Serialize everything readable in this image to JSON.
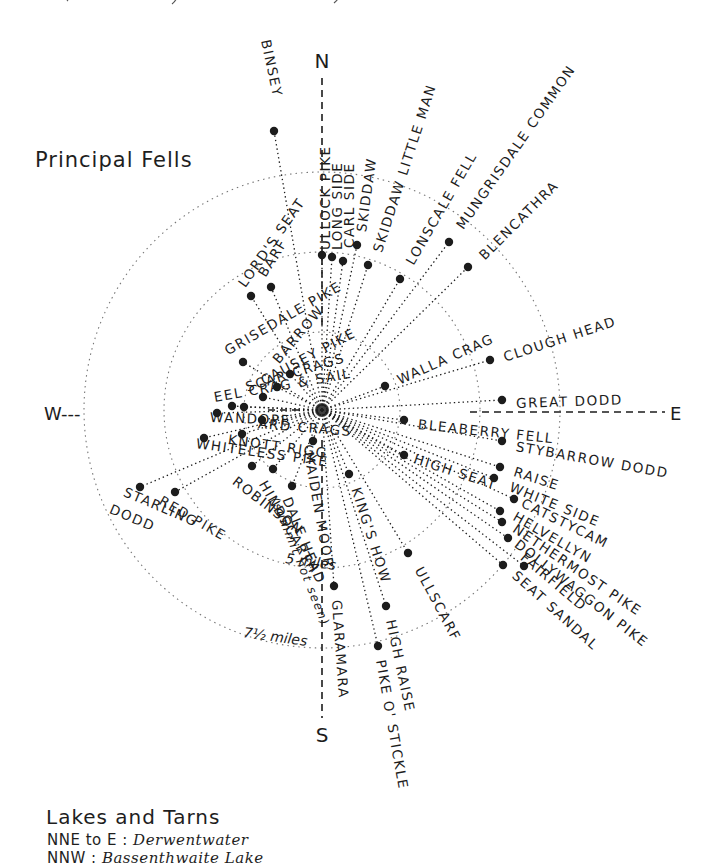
{
  "headings": {
    "principal_fells": "Principal Fells",
    "lakes_and_tarns": "Lakes and Tarns"
  },
  "lakes": [
    {
      "direction": "NNE to E :",
      "name": "Derwentwater"
    },
    {
      "direction": "NNW :",
      "name": "Bassenthwaite Lake"
    }
  ],
  "compass": {
    "center": [
      322,
      410
    ],
    "N": {
      "label": "N",
      "x": 322,
      "y": 72
    },
    "S": {
      "label": "S",
      "x": 322,
      "y": 738
    },
    "E": {
      "label": "E",
      "x": 676,
      "y": 416
    },
    "W": {
      "label": "W---",
      "x": 46,
      "y": 418
    }
  },
  "rings": [
    {
      "label": "5 miles",
      "radius": 158,
      "label_x": 285,
      "label_y": 563,
      "label_rot": 8
    },
    {
      "label": "7½ miles",
      "radius": 238,
      "label_x": 243,
      "label_y": 637,
      "label_rot": 8
    },
    {
      "label": "",
      "radius": 78
    }
  ],
  "colors": {
    "ink": "#1c1c1c",
    "paper": "#ffffff"
  },
  "fells": [
    {
      "name": "BINSEY",
      "dot": [
        274,
        131
      ],
      "label": [
        265,
        40
      ],
      "rot": 78,
      "anchor": "start"
    },
    {
      "name": "ULLOCK PIKE",
      "dot": [
        322,
        255
      ],
      "label": [
        326,
        250
      ],
      "rot": -90,
      "anchor": "start"
    },
    {
      "name": "LONG SIDE",
      "dot": [
        332,
        257
      ],
      "label": [
        338,
        250
      ],
      "rot": -90,
      "anchor": "start"
    },
    {
      "name": "CARL SIDE",
      "dot": [
        343,
        261
      ],
      "label": [
        350,
        248
      ],
      "rot": -90,
      "anchor": "start"
    },
    {
      "name": "SKIDDAW",
      "dot": [
        357,
        245
      ],
      "label": [
        362,
        232
      ],
      "rot": -82,
      "anchor": "start"
    },
    {
      "name": "SKIDDAW LITTLE MAN",
      "dot": [
        368,
        265
      ],
      "label": [
        378,
        252
      ],
      "rot": -72,
      "anchor": "start"
    },
    {
      "name": "LONSCALE FELL",
      "dot": [
        400,
        279
      ],
      "label": [
        410,
        264
      ],
      "rot": -60,
      "anchor": "start"
    },
    {
      "name": "MUNGRISDALE COMMON",
      "dot": [
        449,
        242
      ],
      "label": [
        460,
        228
      ],
      "rot": -55,
      "anchor": "start"
    },
    {
      "name": "BLENCATHRA",
      "dot": [
        468,
        267
      ],
      "label": [
        482,
        258
      ],
      "rot": -45,
      "anchor": "start"
    },
    {
      "name": "CLOUGH HEAD",
      "dot": [
        490,
        360
      ],
      "label": [
        504,
        358
      ],
      "rot": -18,
      "anchor": "start"
    },
    {
      "name": "WALLA CRAG",
      "dot": [
        385,
        386
      ],
      "label": [
        398,
        381
      ],
      "rot": -24,
      "anchor": "start"
    },
    {
      "name": "GREAT DODD",
      "dot": [
        502,
        400
      ],
      "label": [
        516,
        404
      ],
      "rot": -2,
      "anchor": "start"
    },
    {
      "name": "BLEABERRY FELL",
      "dot": [
        404,
        420
      ],
      "label": [
        418,
        425
      ],
      "rot": 6,
      "anchor": "start"
    },
    {
      "name": "STYBARROW DODD",
      "dot": [
        502,
        441
      ],
      "label": [
        516,
        447
      ],
      "rot": 10,
      "anchor": "start"
    },
    {
      "name": "HIGH SEAT",
      "dot": [
        404,
        455
      ],
      "label": [
        414,
        459
      ],
      "rot": 18,
      "anchor": "start"
    },
    {
      "name": "RAISE",
      "dot": [
        500,
        467
      ],
      "label": [
        514,
        472
      ],
      "rot": 18,
      "anchor": "start"
    },
    {
      "name": "WHITE SIDE",
      "dot": [
        494,
        478
      ],
      "label": [
        510,
        487
      ],
      "rot": 22,
      "anchor": "start"
    },
    {
      "name": "CATSTYCAM",
      "dot": [
        514,
        499
      ],
      "label": [
        522,
        503
      ],
      "rot": 26,
      "anchor": "start"
    },
    {
      "name": "HELVELLYN",
      "dot": [
        500,
        511
      ],
      "label": [
        514,
        516
      ],
      "rot": 30,
      "anchor": "start"
    },
    {
      "name": "NETHERMOST PIKE",
      "dot": [
        502,
        522
      ],
      "label": [
        514,
        528
      ],
      "rot": 34,
      "anchor": "start"
    },
    {
      "name": "DOLLYWAGGON PIKE",
      "dot": [
        508,
        538
      ],
      "label": [
        516,
        543
      ],
      "rot": 38,
      "anchor": "start"
    },
    {
      "name": "FAIRFIELD",
      "dot": [
        524,
        566
      ],
      "label": [
        522,
        556
      ],
      "rot": 40,
      "anchor": "start"
    },
    {
      "name": "SEAT SANDAL",
      "dot": [
        503,
        565
      ],
      "label": [
        514,
        574
      ],
      "rot": 42,
      "anchor": "start"
    },
    {
      "name": "ULLSCARF",
      "dot": [
        408,
        553
      ],
      "label": [
        418,
        568
      ],
      "rot": 62,
      "anchor": "start"
    },
    {
      "name": "KING'S HOW",
      "dot": [
        349,
        474
      ],
      "label": [
        355,
        488
      ],
      "rot": 72,
      "anchor": "start"
    },
    {
      "name": "HIGH RAISE",
      "dot": [
        386,
        606
      ],
      "label": [
        390,
        620
      ],
      "rot": 78,
      "anchor": "start"
    },
    {
      "name": "PIKE O' STICKLE",
      "dot": [
        378,
        646
      ],
      "label": [
        380,
        660
      ],
      "rot": 80,
      "anchor": "start"
    },
    {
      "name": "GLARAMARA",
      "dot": [
        334,
        586
      ],
      "label": [
        336,
        600
      ],
      "rot": 86,
      "anchor": "start"
    },
    {
      "name": "MAIDEN MOOR",
      "dot": [
        313,
        441
      ],
      "label": [
        308,
        452
      ],
      "rot": -100,
      "anchor": "end"
    },
    {
      "name": "DALE HEAD",
      "dot": [
        292,
        486
      ],
      "label": [
        286,
        498
      ],
      "rot": -112,
      "anchor": "end"
    },
    {
      "name": "(summit not seen)",
      "dot": null,
      "label": [
        274,
        498
      ],
      "rot": -112,
      "anchor": "end",
      "small": true
    },
    {
      "name": "HINDSCARTH",
      "dot": [
        273,
        469
      ],
      "label": [
        262,
        482
      ],
      "rot": -120,
      "anchor": "end"
    },
    {
      "name": "ROBINSON",
      "dot": [
        252,
        466
      ],
      "label": [
        234,
        480
      ],
      "rot": -142,
      "anchor": "end"
    },
    {
      "name": "RED PIKE",
      "dot": [
        175,
        492
      ],
      "label": [
        160,
        500
      ],
      "rot": -150,
      "anchor": "end"
    },
    {
      "name": "STARLING",
      "dot": [
        140,
        487
      ],
      "label": [
        124,
        492
      ],
      "rot": -157,
      "anchor": "end"
    },
    {
      "name": "DODD",
      "dot": null,
      "label": [
        110,
        509
      ],
      "rot": -157,
      "anchor": "end"
    },
    {
      "name": "KNOTT RIGG",
      "dot": [
        242,
        434
      ],
      "label": [
        228,
        440
      ],
      "rot": -172,
      "anchor": "end"
    },
    {
      "name": "WHITELESS PIKE",
      "dot": [
        204,
        438
      ],
      "label": [
        196,
        444
      ],
      "rot": -172,
      "anchor": "end"
    },
    {
      "name": "ARD CRAGS",
      "dot": [
        262,
        420
      ],
      "label": [
        258,
        424
      ],
      "rot": -175,
      "anchor": "end"
    },
    {
      "name": "WANDOPE",
      "dot": [
        217,
        413
      ],
      "label": [
        210,
        418
      ],
      "rot": -178,
      "anchor": "end"
    },
    {
      "name": "EEL CRAG & SAIL",
      "dot": [
        232,
        406
      ],
      "label": [
        214,
        398
      ],
      "rot": 170,
      "anchor": "end"
    },
    {
      "name": "",
      "dot": [
        244,
        407
      ],
      "label": null,
      "rot": 0
    },
    {
      "name": "SCAR CRAGS",
      "dot": [
        263,
        397
      ],
      "label": [
        246,
        388
      ],
      "rot": 163,
      "anchor": "end"
    },
    {
      "name": "CAUSEY PIKE",
      "dot": [
        243,
        362
      ],
      "label": [
        262,
        382
      ],
      "rot": 152,
      "anchor": "end"
    },
    {
      "name": "GRISEDALE PIKE",
      "dot": [
        277,
        387
      ],
      "label": [
        226,
        352
      ],
      "rot": 150,
      "anchor": "end"
    },
    {
      "name": "BARROW",
      "dot": [
        290,
        374
      ],
      "label": [
        276,
        362
      ],
      "rot": 130,
      "anchor": "end"
    },
    {
      "name": "LORD'S SEAT",
      "dot": [
        251,
        296
      ],
      "label": [
        242,
        286
      ],
      "rot": 125,
      "anchor": "end"
    },
    {
      "name": "BARF",
      "dot": [
        271,
        287
      ],
      "label": [
        262,
        276
      ],
      "rot": 122,
      "anchor": "end"
    }
  ]
}
